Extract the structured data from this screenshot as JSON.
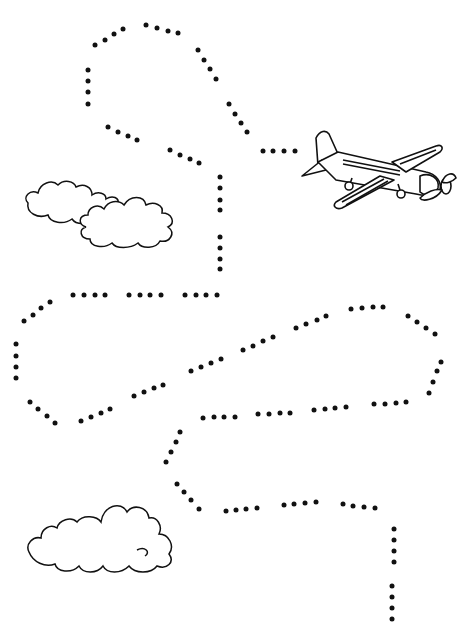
{
  "worksheet": {
    "type": "tracing-path",
    "colors": {
      "background": "#ffffff",
      "ink": "#111111"
    },
    "objects": [
      {
        "name": "airplane",
        "x": 296,
        "y": 126,
        "w": 165,
        "h": 85
      },
      {
        "name": "cloud-top",
        "x": 20,
        "y": 175,
        "w": 175,
        "h": 85
      },
      {
        "name": "cloud-bottom",
        "x": 25,
        "y": 495,
        "w": 155,
        "h": 82
      }
    ],
    "path_dots": [
      [
        95,
        45
      ],
      [
        105,
        40
      ],
      [
        114,
        34
      ],
      [
        123,
        29
      ],
      [
        146,
        25
      ],
      [
        157,
        28
      ],
      [
        168,
        31
      ],
      [
        178,
        33
      ],
      [
        198,
        50
      ],
      [
        204,
        60
      ],
      [
        210,
        69
      ],
      [
        216,
        79
      ],
      [
        229,
        104
      ],
      [
        235,
        114
      ],
      [
        241,
        123
      ],
      [
        247,
        132
      ],
      [
        263,
        151
      ],
      [
        273,
        151
      ],
      [
        284,
        151
      ],
      [
        295,
        151
      ],
      [
        88,
        70
      ],
      [
        88,
        81
      ],
      [
        88,
        92
      ],
      [
        88,
        104
      ],
      [
        108,
        127
      ],
      [
        118,
        132
      ],
      [
        128,
        136
      ],
      [
        137,
        140
      ],
      [
        170,
        150
      ],
      [
        180,
        155
      ],
      [
        190,
        159
      ],
      [
        199,
        163
      ],
      [
        220,
        177
      ],
      [
        220,
        188
      ],
      [
        220,
        200
      ],
      [
        220,
        210
      ],
      [
        220,
        237
      ],
      [
        220,
        248
      ],
      [
        220,
        259
      ],
      [
        220,
        269
      ],
      [
        73,
        295
      ],
      [
        84,
        295
      ],
      [
        95,
        295
      ],
      [
        105,
        295
      ],
      [
        129,
        295
      ],
      [
        140,
        295
      ],
      [
        150,
        295
      ],
      [
        161,
        295
      ],
      [
        185,
        295
      ],
      [
        196,
        295
      ],
      [
        206,
        295
      ],
      [
        217,
        295
      ],
      [
        50,
        302
      ],
      [
        41,
        308
      ],
      [
        33,
        315
      ],
      [
        24,
        321
      ],
      [
        16,
        344
      ],
      [
        16,
        356
      ],
      [
        16,
        367
      ],
      [
        16,
        378
      ],
      [
        30,
        402
      ],
      [
        38,
        409
      ],
      [
        47,
        416
      ],
      [
        55,
        423
      ],
      [
        81,
        421
      ],
      [
        91,
        417
      ],
      [
        101,
        413
      ],
      [
        110,
        409
      ],
      [
        134,
        396
      ],
      [
        144,
        392
      ],
      [
        154,
        388
      ],
      [
        163,
        385
      ],
      [
        191,
        371
      ],
      [
        201,
        367
      ],
      [
        211,
        363
      ],
      [
        221,
        359
      ],
      [
        243,
        350
      ],
      [
        253,
        346
      ],
      [
        263,
        341
      ],
      [
        273,
        337
      ],
      [
        296,
        328
      ],
      [
        306,
        324
      ],
      [
        317,
        320
      ],
      [
        326,
        316
      ],
      [
        351,
        309
      ],
      [
        362,
        308
      ],
      [
        373,
        307
      ],
      [
        383,
        307
      ],
      [
        408,
        316
      ],
      [
        417,
        322
      ],
      [
        426,
        328
      ],
      [
        435,
        334
      ],
      [
        441,
        362
      ],
      [
        437,
        371
      ],
      [
        433,
        382
      ],
      [
        429,
        393
      ],
      [
        406,
        402
      ],
      [
        396,
        403
      ],
      [
        385,
        404
      ],
      [
        374,
        404
      ],
      [
        346,
        407
      ],
      [
        335,
        408
      ],
      [
        325,
        409
      ],
      [
        314,
        410
      ],
      [
        290,
        413
      ],
      [
        280,
        413
      ],
      [
        269,
        414
      ],
      [
        258,
        414
      ],
      [
        235,
        417
      ],
      [
        224,
        417
      ],
      [
        214,
        417
      ],
      [
        203,
        418
      ],
      [
        180,
        432
      ],
      [
        176,
        442
      ],
      [
        171,
        452
      ],
      [
        166,
        462
      ],
      [
        177,
        484
      ],
      [
        184,
        492
      ],
      [
        191,
        500
      ],
      [
        199,
        509
      ],
      [
        226,
        511
      ],
      [
        236,
        510
      ],
      [
        246,
        509
      ],
      [
        257,
        508
      ],
      [
        284,
        505
      ],
      [
        294,
        504
      ],
      [
        305,
        503
      ],
      [
        316,
        502
      ],
      [
        343,
        504
      ],
      [
        353,
        506
      ],
      [
        364,
        507
      ],
      [
        375,
        508
      ],
      [
        394,
        529
      ],
      [
        394,
        540
      ],
      [
        394,
        551
      ],
      [
        394,
        562
      ],
      [
        392,
        586
      ],
      [
        392,
        597
      ],
      [
        392,
        608
      ],
      [
        392,
        619
      ]
    ]
  }
}
